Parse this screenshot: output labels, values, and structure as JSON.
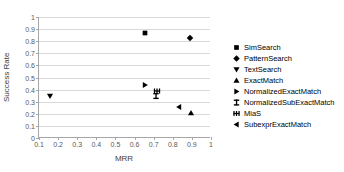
{
  "chart_data": {
    "type": "scatter",
    "title": "",
    "xlabel": "MRR",
    "ylabel": "Success Rate",
    "xlim": [
      0.1,
      1
    ],
    "ylim": [
      0,
      1
    ],
    "xticks": [
      "0.1",
      "0.2",
      "0.3",
      "0.4",
      "0.5",
      "0.6",
      "0.7",
      "0.8",
      "0.9",
      "1"
    ],
    "xtick_values": [
      0.1,
      0.2,
      0.3,
      0.4,
      0.5,
      0.6,
      0.7,
      0.8,
      0.9,
      1
    ],
    "yticks": [
      "0",
      "0.1",
      "0.2",
      "0.3",
      "0.4",
      "0.5",
      "0.6",
      "0.7",
      "0.8",
      "0.9",
      "1"
    ],
    "ytick_values": [
      0,
      0.1,
      0.2,
      0.3,
      0.4,
      0.5,
      0.6,
      0.7,
      0.8,
      0.9,
      1
    ],
    "grid": "horizontal",
    "legend_position": "right",
    "series": [
      {
        "name": "SimSearch",
        "marker": "square",
        "x": 0.655,
        "y": 0.87
      },
      {
        "name": "PatternSearch",
        "marker": "diamond",
        "x": 0.89,
        "y": 0.825
      },
      {
        "name": "TextSearch",
        "marker": "triangle-down",
        "x": 0.16,
        "y": 0.35
      },
      {
        "name": "ExactMatch",
        "marker": "triangle-up",
        "x": 0.895,
        "y": 0.21
      },
      {
        "name": "NormalizedExactMatch",
        "marker": "triangle-right",
        "x": 0.655,
        "y": 0.435
      },
      {
        "name": "NormalizedSubExactMatch",
        "marker": "i-beam",
        "x": 0.71,
        "y": 0.345
      },
      {
        "name": "MiaS",
        "marker": "asterisk",
        "x": 0.715,
        "y": 0.39
      },
      {
        "name": "SubexprExactMatch",
        "marker": "triangle-left",
        "x": 0.835,
        "y": 0.26
      }
    ]
  },
  "colors": {
    "marker": "#000000",
    "gridline": "#d9d9d9",
    "axis": "#a6a6a6",
    "tick_text": "#595959",
    "axis_title": "#404040",
    "background": "#ffffff"
  }
}
